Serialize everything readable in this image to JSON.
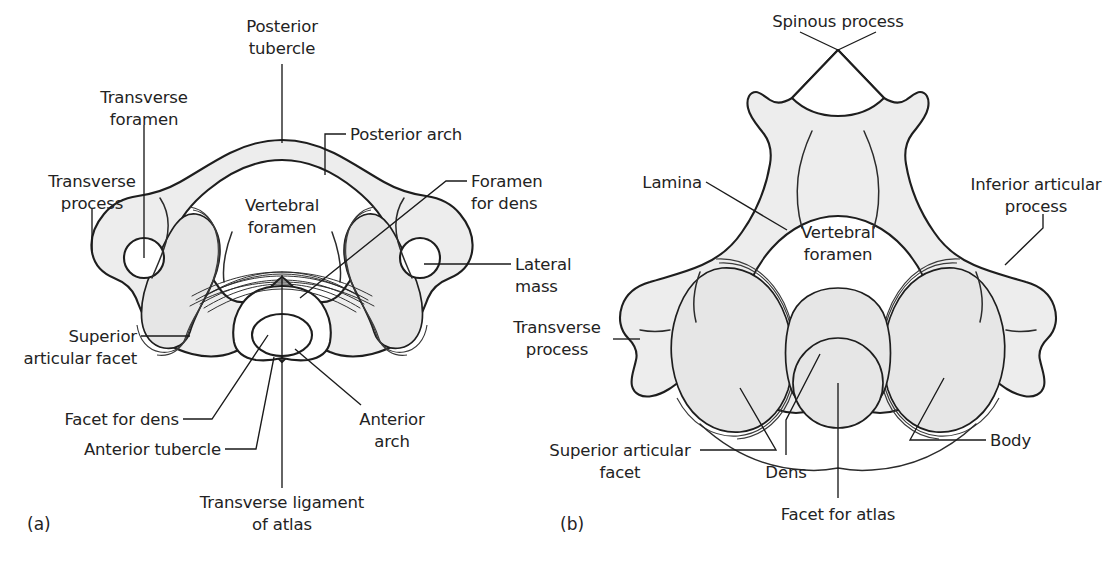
{
  "figure": {
    "background_color": "#ffffff",
    "ink_color": "#1e1e1e",
    "bone_fill_color": "#ededed",
    "facet_fill_color": "#e6e6e6",
    "text_color": "#232323"
  },
  "panels": [
    {
      "id": "a",
      "letter": "(a)",
      "subject": "Atlas, superior view",
      "labels": [
        {
          "key": "posterior_tubercle",
          "lines": [
            "Posterior",
            "tubercle"
          ],
          "anchor": "middle"
        },
        {
          "key": "transverse_foramen",
          "lines": [
            "Transverse",
            "foramen"
          ],
          "anchor": "middle"
        },
        {
          "key": "transverse_process",
          "lines": [
            "Transverse",
            "process"
          ],
          "anchor": "middle"
        },
        {
          "key": "posterior_arch",
          "lines": [
            "Posterior arch"
          ],
          "anchor": "start"
        },
        {
          "key": "vertebral_foramen",
          "lines": [
            "Vertebral",
            "foramen"
          ],
          "anchor": "middle"
        },
        {
          "key": "foramen_for_dens",
          "lines": [
            "Foramen",
            "for dens"
          ],
          "anchor": "start"
        },
        {
          "key": "lateral_mass",
          "lines": [
            "Lateral",
            "mass"
          ],
          "anchor": "start"
        },
        {
          "key": "superior_articular_facet",
          "lines": [
            "Superior",
            "articular facet"
          ],
          "anchor": "middle"
        },
        {
          "key": "facet_for_dens",
          "lines": [
            "Facet for dens"
          ],
          "anchor": "end"
        },
        {
          "key": "anterior_tubercle",
          "lines": [
            "Anterior tubercle"
          ],
          "anchor": "end"
        },
        {
          "key": "anterior_arch",
          "lines": [
            "Anterior",
            "arch"
          ],
          "anchor": "middle"
        },
        {
          "key": "transverse_ligament",
          "lines": [
            "Transverse ligament",
            "of atlas"
          ],
          "anchor": "middle"
        }
      ]
    },
    {
      "id": "b",
      "letter": "(b)",
      "subject": "Axis, superior view",
      "labels": [
        {
          "key": "spinous_process",
          "lines": [
            "Spinous process"
          ],
          "anchor": "middle"
        },
        {
          "key": "lamina",
          "lines": [
            "Lamina"
          ],
          "anchor": "end"
        },
        {
          "key": "inferior_articular_process",
          "lines": [
            "Inferior articular",
            "process"
          ],
          "anchor": "middle"
        },
        {
          "key": "vertebral_foramen",
          "lines": [
            "Vertebral",
            "foramen"
          ],
          "anchor": "middle"
        },
        {
          "key": "transverse_process",
          "lines": [
            "Transverse",
            "process"
          ],
          "anchor": "middle"
        },
        {
          "key": "superior_articular_facet",
          "lines": [
            "Superior articular",
            "facet"
          ],
          "anchor": "middle"
        },
        {
          "key": "dens",
          "lines": [
            "Dens"
          ],
          "anchor": "middle"
        },
        {
          "key": "facet_for_atlas",
          "lines": [
            "Facet for atlas"
          ],
          "anchor": "middle"
        },
        {
          "key": "body",
          "lines": [
            "Body"
          ],
          "anchor": "start"
        }
      ]
    }
  ],
  "text": {
    "a": {
      "posterior_tubercle_1": "Posterior",
      "posterior_tubercle_2": "tubercle",
      "transverse_foramen_1": "Transverse",
      "transverse_foramen_2": "foramen",
      "transverse_process_1": "Transverse",
      "transverse_process_2": "process",
      "posterior_arch": "Posterior arch",
      "vertebral_foramen_1": "Vertebral",
      "vertebral_foramen_2": "foramen",
      "foramen_for_dens_1": "Foramen",
      "foramen_for_dens_2": "for dens",
      "lateral_mass_1": "Lateral",
      "lateral_mass_2": "mass",
      "superior_articular_facet_1": "Superior",
      "superior_articular_facet_2": "articular facet",
      "facet_for_dens": "Facet for dens",
      "anterior_tubercle": "Anterior tubercle",
      "anterior_arch_1": "Anterior",
      "anterior_arch_2": "arch",
      "transverse_ligament_1": "Transverse ligament",
      "transverse_ligament_2": "of atlas",
      "panel_letter": "(a)"
    },
    "b": {
      "spinous_process": "Spinous process",
      "lamina": "Lamina",
      "inferior_articular_process_1": "Inferior articular",
      "inferior_articular_process_2": "process",
      "vertebral_foramen_1": "Vertebral",
      "vertebral_foramen_2": "foramen",
      "transverse_process_1": "Transverse",
      "transverse_process_2": "process",
      "superior_articular_facet_1": "Superior articular",
      "superior_articular_facet_2": "facet",
      "dens": "Dens",
      "facet_for_atlas": "Facet for atlas",
      "body": "Body",
      "panel_letter": "(b)"
    }
  }
}
